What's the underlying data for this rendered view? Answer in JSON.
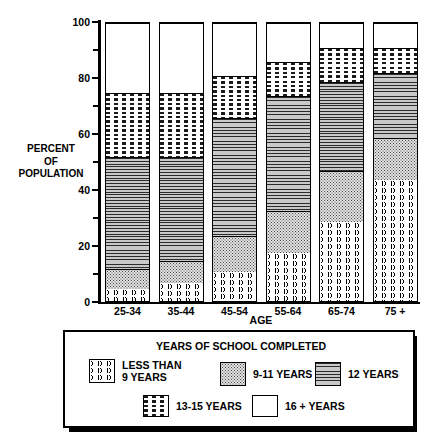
{
  "chart_data": {
    "type": "bar",
    "stacked": true,
    "title": "",
    "xlabel": "AGE",
    "ylabel": "PERCENT OF POPULATION",
    "ylabel_lines": [
      "PERCENT",
      "OF",
      "POPULATION"
    ],
    "ylim": [
      0,
      100
    ],
    "yticks": [
      0,
      20,
      40,
      60,
      80,
      100
    ],
    "ytick_labels": [
      "0",
      "20",
      "40",
      "60",
      "80",
      "100"
    ],
    "minor_yticks": [
      10,
      30,
      50,
      70,
      90
    ],
    "grid": false,
    "legend_position": "bottom",
    "legend_title": "YEARS OF SCHOOL COMPLETED",
    "categories": [
      "25-34",
      "35-44",
      "45-54",
      "55-64",
      "65-74",
      "75 +"
    ],
    "series": [
      {
        "name": "LESS THAN 9 YEARS",
        "pattern": "wavy-lines",
        "values": [
          5,
          7,
          11,
          18,
          29,
          44
        ]
      },
      {
        "name": "9-11 YEARS",
        "pattern": "dotted-stipple",
        "values": [
          7,
          8,
          13,
          15,
          18,
          15
        ]
      },
      {
        "name": "12 YEARS",
        "pattern": "horizontal-lines",
        "values": [
          40,
          37,
          42,
          41,
          32,
          23
        ]
      },
      {
        "name": "13-15 YEARS",
        "pattern": "dashed-lines",
        "values": [
          23,
          23,
          15,
          12,
          12,
          9
        ]
      },
      {
        "name": "16 + YEARS",
        "pattern": "solid-white",
        "values": [
          25,
          25,
          19,
          14,
          9,
          9
        ]
      }
    ],
    "cumulative_tops": [
      [
        5,
        12,
        52,
        75,
        100
      ],
      [
        7,
        15,
        52,
        75,
        100
      ],
      [
        11,
        24,
        66,
        81,
        100
      ],
      [
        18,
        33,
        74,
        86,
        100
      ],
      [
        29,
        47,
        79,
        91,
        100
      ],
      [
        44,
        59,
        82,
        91,
        100
      ]
    ]
  },
  "legend": {
    "title": "YEARS OF SCHOOL COMPLETED",
    "entries": [
      {
        "label": "LESS THAN\n9 YEARS",
        "pattern": "wavy-lines"
      },
      {
        "label": "9-11 YEARS",
        "pattern": "dotted-stipple"
      },
      {
        "label": "12 YEARS",
        "pattern": "horizontal-lines"
      },
      {
        "label": "13-15 YEARS",
        "pattern": "dashed-lines"
      },
      {
        "label": "16 +  YEARS",
        "pattern": "solid-white"
      }
    ]
  },
  "colors": {
    "ink": "#000000",
    "background": "#ffffff",
    "fill_9_11": "#e2e2e2",
    "fill_12": "#c9c9c9"
  }
}
